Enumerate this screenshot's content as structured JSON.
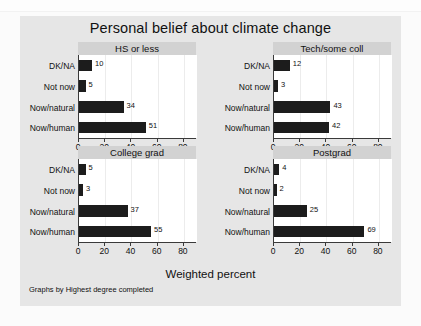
{
  "chart_data": {
    "type": "bar",
    "title": "Personal belief about climate change",
    "xlabel": "Weighted percent",
    "ylabel": "",
    "footnote": "Graphs by Highest degree completed",
    "orientation": "horizontal",
    "xlim": [
      0,
      90
    ],
    "xticks": [
      0,
      20,
      40,
      60,
      80
    ],
    "grid": true,
    "legend": "none",
    "categories": [
      "Now/human",
      "Now/natural",
      "Not now",
      "DK/NA"
    ],
    "panels": [
      {
        "label": "HS or less",
        "categories": [
          "DK/NA",
          "Not now",
          "Now/natural",
          "Now/human"
        ],
        "values": [
          10,
          5,
          34,
          51
        ]
      },
      {
        "label": "Tech/some coll",
        "categories": [
          "DK/NA",
          "Not now",
          "Now/natural",
          "Now/human"
        ],
        "values": [
          12,
          3,
          43,
          42
        ]
      },
      {
        "label": "College grad",
        "categories": [
          "DK/NA",
          "Not now",
          "Now/natural",
          "Now/human"
        ],
        "values": [
          5,
          3,
          37,
          55
        ]
      },
      {
        "label": "Postgrad",
        "categories": [
          "DK/NA",
          "Not now",
          "Now/natural",
          "Now/human"
        ],
        "values": [
          4,
          2,
          25,
          69
        ]
      }
    ],
    "colors": {
      "bar": "#1c1c1c",
      "panel_background": "#e6e6e6",
      "plot_background": "#ffffff",
      "panel_header": "#d2d2d2",
      "axis": "#3a3a3a"
    }
  }
}
